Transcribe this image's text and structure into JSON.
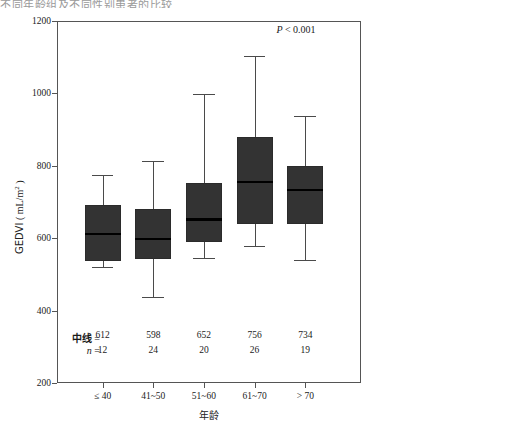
{
  "figure": {
    "clipped_header_text": "不同年龄组及不同性别患者的比较",
    "background": "#ffffff",
    "box_fill": "#333333",
    "median_color": "#000000"
  },
  "chart_data": [
    {
      "id": "age-panel",
      "type": "box",
      "title": "",
      "xlabel": "年龄",
      "ylabel": "GEDVI（mL/m²）",
      "ylabel_parts": {
        "name": "GEDVI",
        "units": "( mL/m² )"
      },
      "ylim": [
        200,
        1200
      ],
      "yticks": [
        200,
        400,
        600,
        800,
        1000,
        1200
      ],
      "ytick_labels": [
        "200",
        "400",
        "600",
        "800",
        "1000",
        "1200"
      ],
      "grid": false,
      "annotation": {
        "p_text": "P < 0.001",
        "p_italic": "P",
        "p_rest": " < 0.001"
      },
      "categories": [
        "≤ 40",
        "41~50",
        "51~60",
        "61~70",
        "> 70"
      ],
      "stat_rows": [
        {
          "label": "中线",
          "eq": "=",
          "values": [
            "612",
            "598",
            "652",
            "756",
            "734"
          ]
        },
        {
          "label": "n",
          "eq": "=",
          "values": [
            "12",
            "24",
            "20",
            "26",
            "19"
          ]
        }
      ],
      "boxes": [
        {
          "category": "≤ 40",
          "whisker_low": 520,
          "q1": 538,
          "median": 612,
          "q3": 692,
          "whisker_high": 775,
          "outliers": []
        },
        {
          "category": "41~50",
          "whisker_low": 438,
          "q1": 542,
          "median": 598,
          "q3": 682,
          "whisker_high": 812,
          "outliers": []
        },
        {
          "category": "51~60",
          "whisker_low": 545,
          "q1": 590,
          "median": 652,
          "q3": 752,
          "whisker_high": 997,
          "outliers": []
        },
        {
          "category": "61~70",
          "whisker_low": 578,
          "q1": 640,
          "median": 756,
          "q3": 880,
          "whisker_high": 1103,
          "outliers": []
        },
        {
          "category": "> 70",
          "whisker_low": 540,
          "q1": 640,
          "median": 734,
          "q3": 800,
          "whisker_high": 938,
          "outliers": []
        }
      ]
    },
    {
      "id": "sex-panel",
      "type": "box",
      "title": "",
      "xlabel": "",
      "ylabel": "GEDVI（mL/m²）",
      "ylabel_parts": {
        "name": "GEDVI",
        "units": "( mL/m² )"
      },
      "ylim": [
        200,
        1200
      ],
      "yticks": [
        200,
        400,
        600,
        800,
        1000,
        1200
      ],
      "ytick_labels": [
        "200",
        "400",
        "600",
        "800",
        "1000",
        "1200"
      ],
      "grid": false,
      "annotation": {
        "p_text": "P < 0.001",
        "p_italic": "P",
        "p_rest": " < 0.001"
      },
      "bracket": true,
      "categories": [
        "男",
        "女"
      ],
      "stat_rows": [
        {
          "label": "中线",
          "eq": "=",
          "values": [
            "746",
            "631"
          ]
        },
        {
          "label": "n",
          "eq": "=",
          "values": [
            "41",
            "60"
          ]
        }
      ],
      "boxes": [
        {
          "category": "男",
          "whisker_low": 538,
          "q1": 645,
          "median": 746,
          "q3": 818,
          "whisker_high": 982,
          "outliers": [
            1063
          ]
        },
        {
          "category": "女",
          "whisker_low": 438,
          "q1": 562,
          "median": 631,
          "q3": 712,
          "whisker_high": 878,
          "outliers": [
            1090,
            965,
            938
          ]
        }
      ]
    }
  ]
}
